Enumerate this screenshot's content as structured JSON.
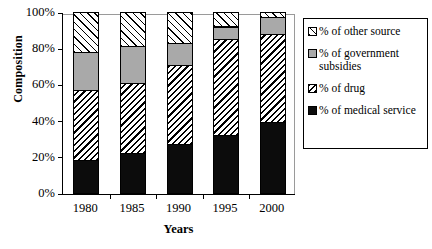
{
  "chart_data": {
    "type": "bar",
    "stacked": true,
    "title": "",
    "xlabel": "Years",
    "ylabel": "Composition",
    "categories": [
      "1980",
      "1985",
      "1990",
      "1995",
      "2000"
    ],
    "ylim": [
      0,
      100
    ],
    "yticks": [
      "0%",
      "20%",
      "40%",
      "60%",
      "80%",
      "100%"
    ],
    "ytick_values": [
      0,
      20,
      40,
      60,
      80,
      100
    ],
    "grid": false,
    "legend_position": "right",
    "series": [
      {
        "name": "% of medical service",
        "pattern": "solid-black",
        "color": "#0c0c0c",
        "values": [
          18,
          22,
          27,
          32,
          39
        ]
      },
      {
        "name": "% of drug",
        "pattern": "dense-diagonal-hatch",
        "color": "#ffffff",
        "values": [
          39,
          39,
          44,
          53,
          49
        ]
      },
      {
        "name": "% of government subsidies",
        "pattern": "solid-gray",
        "color": "#a9a9a9",
        "values": [
          21,
          20,
          12,
          7,
          9
        ]
      },
      {
        "name": "% of other source",
        "pattern": "light-diagonal-hatch",
        "color": "#ffffff",
        "values": [
          22,
          19,
          17,
          8,
          3
        ]
      }
    ],
    "cumulative_tops": {
      "1980": [
        18,
        57,
        78,
        100
      ],
      "1985": [
        22,
        61,
        81,
        100
      ],
      "1990": [
        27,
        71,
        83,
        100
      ],
      "1995": [
        32,
        85,
        92,
        100
      ],
      "2000": [
        39,
        88,
        97,
        100
      ]
    }
  },
  "legend": {
    "items": [
      {
        "label": "% of other source",
        "swatch": "light-diagonal-hatch"
      },
      {
        "label": "% of government subsidies",
        "swatch": "solid-gray"
      },
      {
        "label": "% of drug",
        "swatch": "dense-diagonal-hatch"
      },
      {
        "label": "% of medical service",
        "swatch": "solid-black"
      }
    ]
  }
}
